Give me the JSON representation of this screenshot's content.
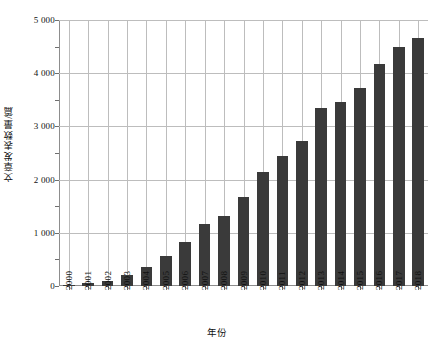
{
  "chart_data": {
    "type": "bar",
    "title": "",
    "xlabel": "年份",
    "ylabel": "文章发表数量/篇",
    "categories": [
      "2000",
      "2001",
      "2002",
      "2003",
      "2004",
      "2005",
      "2006",
      "2007",
      "2008",
      "2009",
      "2010",
      "2011",
      "2012",
      "2013",
      "2014",
      "2015",
      "2016",
      "2017",
      "2018"
    ],
    "values": [
      10,
      50,
      90,
      210,
      360,
      560,
      820,
      1160,
      1320,
      1680,
      2140,
      2440,
      2720,
      3350,
      3450,
      3720,
      4170,
      4490,
      4670
    ],
    "ylim": [
      0,
      5000
    ],
    "yticks": [
      0,
      1000,
      2000,
      3000,
      4000,
      5000
    ],
    "ytick_labels": [
      "0",
      "1 000",
      "2 000",
      "3 000",
      "4 000",
      "5 000"
    ],
    "y_minor_interval": 500,
    "grid": "horizontal-and-vertical",
    "legend": "none",
    "bar_color": "#3a3a3a",
    "grid_color": "#bdbdbd",
    "axis_color": "#8d8d8d"
  }
}
